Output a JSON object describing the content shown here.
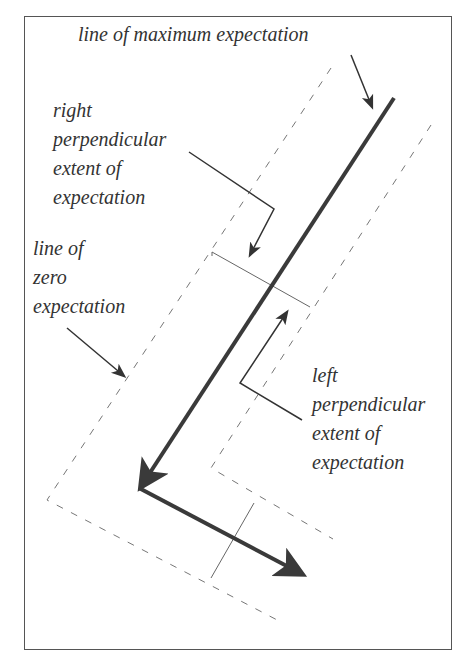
{
  "diagram": {
    "labels": {
      "max_expectation": "line of maximum expectation",
      "right_perp": "right\nperpendicular\nextent of\nexpectation",
      "zero_expectation": "line of\nzero\nexpectation",
      "left_perp": "left\nperpendicular\nextent of\nexpectation"
    },
    "colors": {
      "frame": "#555555",
      "main_path": "#3a3a3a",
      "dashed": "#777777",
      "pointer": "#333333",
      "text": "#333333"
    }
  }
}
